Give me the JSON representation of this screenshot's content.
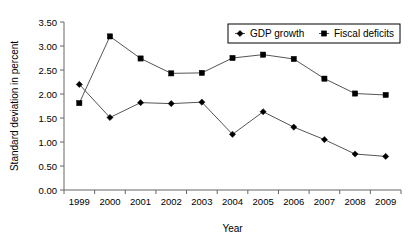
{
  "chart_data": {
    "type": "line",
    "title": "",
    "xlabel": "Year",
    "ylabel": "Standard deviation in percent",
    "categories": [
      "1999",
      "2000",
      "2001",
      "2002",
      "2003",
      "2004",
      "2005",
      "2006",
      "2007",
      "2008",
      "2009"
    ],
    "ylim": [
      0.0,
      3.5
    ],
    "ytick_labels": [
      "0.00",
      "0.50",
      "1.00",
      "1.50",
      "2.00",
      "2.50",
      "3.00",
      "3.50"
    ],
    "ytick_values": [
      0.0,
      0.5,
      1.0,
      1.5,
      2.0,
      2.5,
      3.0,
      3.5
    ],
    "grid": false,
    "legend_position": "top-right",
    "series": [
      {
        "name": "GDP growth",
        "marker": "diamond",
        "color": "#000000",
        "values": [
          2.2,
          1.51,
          1.82,
          1.8,
          1.83,
          1.16,
          1.63,
          1.31,
          1.05,
          0.75,
          0.7
        ]
      },
      {
        "name": "Fiscal deficits",
        "marker": "square",
        "color": "#000000",
        "values": [
          1.81,
          3.2,
          2.74,
          2.43,
          2.44,
          2.75,
          2.82,
          2.73,
          2.32,
          2.01,
          1.98
        ]
      }
    ]
  }
}
